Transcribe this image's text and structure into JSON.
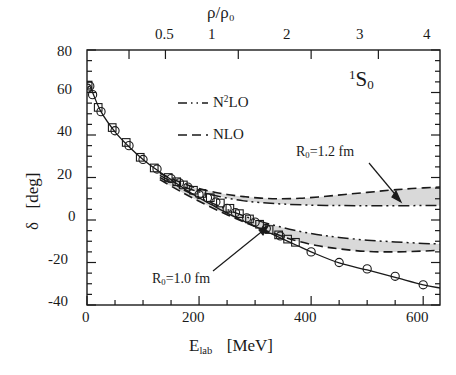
{
  "figure": {
    "state_label_pre": "1",
    "state_label_main": "S",
    "state_label_sub": "0"
  },
  "axes": {
    "x_bottom": {
      "title_main": "E",
      "title_sub": "lab",
      "title_unit": "[MeV]",
      "ticks": [
        "0",
        "200",
        "400",
        "600"
      ],
      "tick_values": [
        0,
        200,
        400,
        600
      ],
      "range": [
        0,
        630
      ],
      "minor_step": 50
    },
    "x_top": {
      "title": "ρ/ρ₀",
      "ticks": [
        "0.5",
        "1",
        "2",
        "3",
        "4"
      ],
      "tick_positions_mev": [
        75,
        140,
        270,
        400,
        520
      ]
    },
    "y": {
      "title_sym": "δ",
      "title_unit": "[deg]",
      "ticks": [
        "80",
        "60",
        "40",
        "20",
        "0",
        "-20",
        "-40"
      ],
      "tick_values": [
        80,
        60,
        40,
        20,
        0,
        -20,
        -40
      ],
      "range": [
        -40,
        80
      ],
      "minor_step": 5
    }
  },
  "legend": {
    "items": [
      {
        "label_pre": "N",
        "label_sup": "2",
        "label_post": "LO",
        "style": "dash-dot-dot"
      },
      {
        "label_pre": "NLO",
        "label_sup": "",
        "label_post": "",
        "style": "dashed"
      }
    ]
  },
  "annotations": [
    {
      "name": "R0-1.2",
      "text_pre": "R",
      "text_sub": "0",
      "text_post": "=1.2  fm"
    },
    {
      "name": "R0-1.0",
      "text_pre": "R",
      "text_sub": "0",
      "text_post": "=1.0  fm"
    }
  ],
  "colors": {
    "line": "#1a1a1a",
    "band_fill": "#d9d9d9",
    "background": "#ffffff"
  },
  "chart_data": {
    "type": "line",
    "title": "",
    "xlabel": "E_lab [MeV]",
    "ylabel": "δ [deg]",
    "xlim": [
      0,
      630
    ],
    "ylim": [
      -40,
      80
    ],
    "grid": false,
    "legend_position": "upper-center",
    "secondary_xaxis": {
      "label": "ρ/ρ₀",
      "ticks": [
        0.5,
        1,
        2,
        3,
        4
      ]
    },
    "series": [
      {
        "name": "Nijmegen PWA (solid line)",
        "type": "line",
        "style": "solid",
        "x": [
          1,
          5,
          10,
          25,
          50,
          75,
          100,
          125,
          150,
          175,
          200,
          225,
          250,
          275,
          300,
          325,
          350,
          375,
          400,
          450,
          500,
          550,
          600,
          630
        ],
        "y": [
          62,
          63,
          60,
          51,
          41.5,
          34.5,
          28.5,
          23.5,
          19,
          14.5,
          10.5,
          6.8,
          3.2,
          0,
          -3,
          -6,
          -9,
          -12,
          -15,
          -20.2,
          -23.5,
          -27,
          -30.5,
          -32
        ]
      },
      {
        "name": "PWA data (open circles)",
        "type": "scatter",
        "marker": "circle-open",
        "x": [
          1,
          5,
          10,
          25,
          50,
          75,
          100,
          125,
          150,
          165,
          180,
          200,
          215,
          230,
          250,
          265,
          285,
          300,
          320,
          345,
          400,
          450,
          500,
          550,
          600
        ],
        "y": [
          62,
          63,
          59,
          51,
          42,
          35,
          28.5,
          24,
          19.5,
          17.5,
          15.5,
          12,
          10.5,
          8.5,
          5.5,
          3.5,
          1,
          -1,
          -4,
          -7.5,
          -15,
          -20,
          -23,
          -26.5,
          -30.5
        ]
      },
      {
        "name": "PWA data (open squares)",
        "type": "scatter",
        "marker": "square-open",
        "x": [
          2,
          20,
          45,
          70,
          95,
          120,
          145,
          160,
          172,
          190,
          205,
          220,
          238,
          255,
          272,
          290,
          308,
          325,
          342,
          358,
          372
        ],
        "y": [
          63.5,
          53,
          43.5,
          36.5,
          29.5,
          24.5,
          20,
          18,
          16.5,
          14,
          12.5,
          10.5,
          8,
          5.5,
          3,
          0.5,
          -2,
          -4.5,
          -7,
          -9,
          -10.5
        ]
      },
      {
        "name": "NLO band R0=1.2 fm (upper edge, dashed)",
        "type": "line",
        "style": "dashed",
        "x": [
          130,
          160,
          190,
          220,
          250,
          280,
          310,
          340,
          380,
          420,
          460,
          500,
          540,
          580,
          630
        ],
        "y": [
          22,
          18.5,
          15.5,
          13.5,
          12,
          11,
          10.3,
          10,
          10.2,
          11,
          12,
          13,
          14,
          14.8,
          15.5
        ]
      },
      {
        "name": "N2LO band R0=1.2 fm (lower edge, dash-dot)",
        "type": "line",
        "style": "dash-dot-dot",
        "x": [
          130,
          160,
          190,
          220,
          250,
          280,
          310,
          350,
          400,
          450,
          500,
          550,
          600,
          630
        ],
        "y": [
          21,
          17,
          14,
          12,
          10.3,
          9,
          8.2,
          7.5,
          7,
          6.8,
          6.7,
          6.7,
          6.8,
          6.8
        ]
      },
      {
        "name": "N2LO band R0=1.0 fm (upper edge, dash-dot)",
        "type": "line",
        "style": "dash-dot-dot",
        "x": [
          130,
          170,
          210,
          250,
          290,
          330,
          370,
          410,
          450,
          500,
          550,
          600,
          630
        ],
        "y": [
          20,
          14.5,
          9.5,
          5,
          1,
          -2.2,
          -4.8,
          -6.8,
          -8.2,
          -9.5,
          -10.3,
          -11,
          -11.3
        ]
      },
      {
        "name": "NLO band R0=1.0 fm (lower edge, dashed)",
        "type": "line",
        "style": "dashed",
        "x": [
          130,
          170,
          210,
          250,
          290,
          330,
          370,
          410,
          450,
          500,
          550,
          600,
          630
        ],
        "y": [
          19,
          13,
          7.5,
          2.5,
          -2,
          -6,
          -9.5,
          -12,
          -13.6,
          -14.8,
          -15,
          -14.6,
          -14.2
        ]
      }
    ],
    "bands": [
      {
        "name": "R0=1.2 fm band",
        "upper_series": "NLO band R0=1.2 fm (upper edge, dashed)",
        "lower_series": "N2LO band R0=1.2 fm (lower edge, dash-dot)",
        "fill": "#d9d9d9"
      },
      {
        "name": "R0=1.0 fm band",
        "upper_series": "N2LO band R0=1.0 fm (upper edge, dash-dot)",
        "lower_series": "NLO band R0=1.0 fm (lower edge, dashed)",
        "fill": "#d9d9d9"
      }
    ]
  }
}
